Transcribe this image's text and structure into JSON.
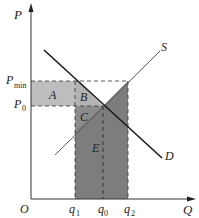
{
  "diagram": {
    "axes": {
      "y_label": "P",
      "x_label": "Q",
      "origin_label": "O"
    },
    "price_labels": {
      "pmin": "P",
      "pmin_sub": "min",
      "p0": "P",
      "p0_sub": "0"
    },
    "quantity_labels": {
      "q1": "q",
      "q1_sub": "1",
      "q0": "q",
      "q0_sub": "0",
      "q2": "q",
      "q2_sub": "2"
    },
    "curves": {
      "supply": "S",
      "demand": "D"
    },
    "regions": {
      "a": "A",
      "b": "B",
      "c": "C",
      "e": "E"
    },
    "colors": {
      "light_shade": "#b8b8b8",
      "dark_shade": "#7a7a7a",
      "line": "#1a1a1a",
      "supply_line": "#555555"
    }
  }
}
